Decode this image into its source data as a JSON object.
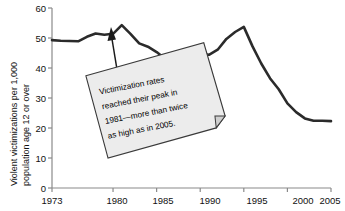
{
  "chart_data": {
    "type": "line",
    "title": "",
    "xlabel": "",
    "ylabel": "Violent victimizations per 1,000 population age 12 or over",
    "ylabel_line1": "Violent victimizations per 1,000",
    "ylabel_line2": "population age 12 or over",
    "xlim": [
      1973,
      2005
    ],
    "ylim": [
      0,
      60
    ],
    "yticks": [
      0,
      10,
      20,
      30,
      40,
      50,
      60
    ],
    "ytick_labels": [
      "0",
      "10",
      "20",
      "30",
      "40",
      "50",
      "60"
    ],
    "xticks": [
      1973,
      1980,
      1985,
      1990,
      1995,
      2000,
      2005
    ],
    "xtick_labels": [
      "1973",
      "1980",
      "1985",
      "1990",
      "1995",
      "2000",
      "2005"
    ],
    "grid": false,
    "legend": false,
    "line_color": "#2b2b2b",
    "line_width": 2.6,
    "x": [
      1973,
      1974,
      1975,
      1976,
      1977,
      1978,
      1979,
      1980,
      1981,
      1982,
      1983,
      1984,
      1985,
      1986,
      1987,
      1988,
      1989,
      1990,
      1991,
      1992,
      1993,
      1994,
      1995,
      1996,
      1997,
      1998,
      1999,
      2000,
      2001,
      2002,
      2003,
      2004,
      2005
    ],
    "values": [
      49.3,
      49.1,
      49.0,
      48.9,
      50.4,
      51.5,
      51.1,
      51.4,
      54.3,
      51.4,
      48.2,
      47.1,
      45.3,
      43.0,
      44.2,
      45.5,
      45.5,
      44.8,
      44.4,
      46.1,
      49.7,
      52.0,
      53.7,
      47.2,
      41.5,
      36.6,
      32.9,
      28.2,
      25.3,
      23.2,
      22.4,
      22.4,
      22.3
    ],
    "annotation": {
      "text_lines": [
        "Victimization rates",
        "reached their peak in",
        "1981—more than twice",
        "as high as in 2005."
      ],
      "points_to_year": 1981,
      "points_to_value": 54.3,
      "box_fill": "#ececec",
      "box_border": "#3a3a3a"
    }
  }
}
